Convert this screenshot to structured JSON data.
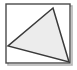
{
  "figure": {
    "title": "Triangle inscribed in a rectangle",
    "canvas": {
      "width": 77,
      "height": 70,
      "background_color": "#ffffff"
    },
    "shadow": {
      "name": "drop-shadow",
      "color": "#b4b4b4",
      "offset_x": 2,
      "offset_y": 2,
      "visible": true
    },
    "rectangle": {
      "label": "outer rectangle frame",
      "x": 6,
      "y": 4,
      "width": 64,
      "height": 59,
      "stroke_color": "#4a4a4a",
      "stroke_width": 1.4,
      "fill_color": "#ffffff"
    },
    "triangle": {
      "label": "inscribed triangle",
      "fill_color": "#ececec",
      "stroke_color": "#3a3a3a",
      "stroke_width": 1.5,
      "points": "53,8 8,46 69,62",
      "vertices": [
        {
          "name": "apex-vertex",
          "x": 53,
          "y": 8
        },
        {
          "name": "left-vertex",
          "x": 8,
          "y": 46
        },
        {
          "name": "bottom-right-vertex",
          "x": 69,
          "y": 62
        }
      ]
    }
  }
}
